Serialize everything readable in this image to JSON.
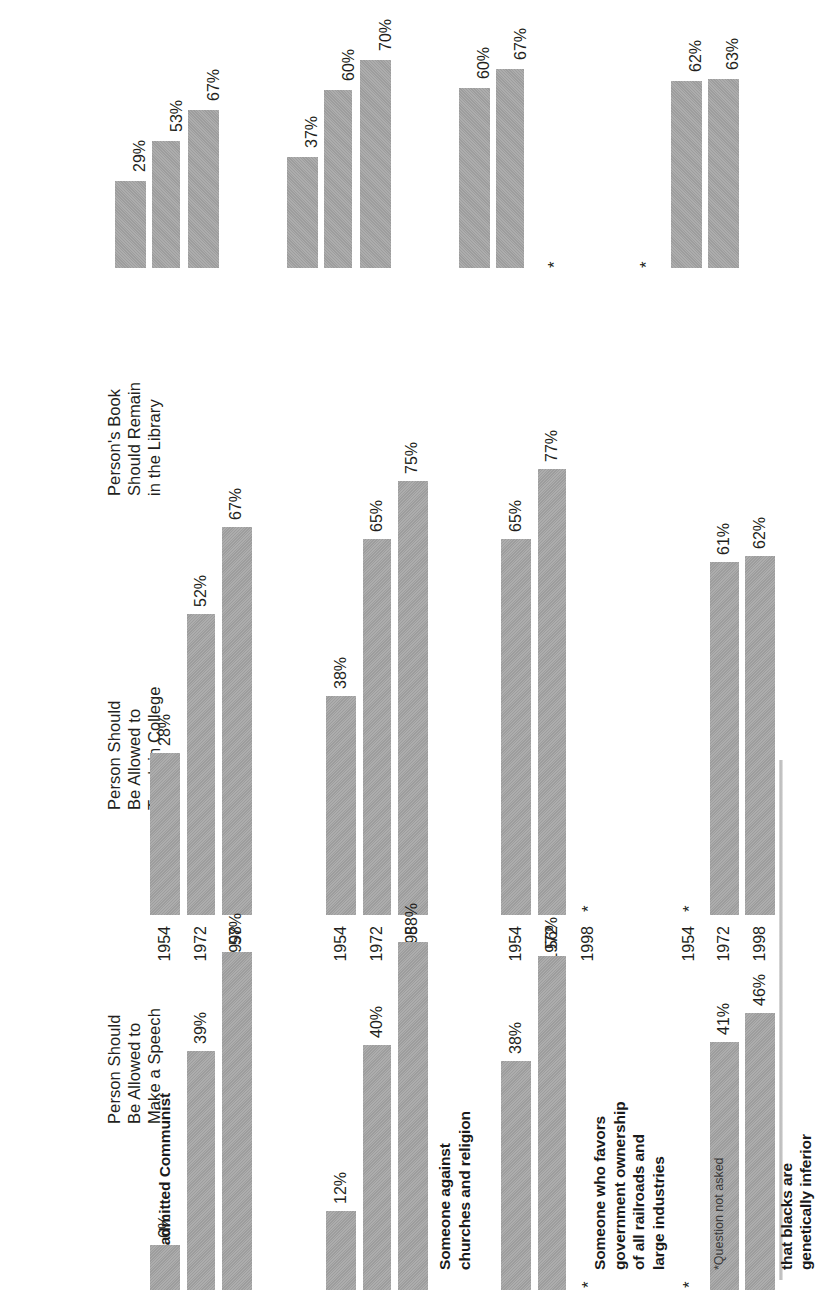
{
  "figure": {
    "footnote": "*Question not asked",
    "not_asked_mark": "*",
    "bar_color": "#9d9d9d",
    "text_color": "#231f20"
  },
  "panels": [
    {
      "title": "Person Should\nBe Allowed to\nMake a Speech"
    },
    {
      "title": "Person Should\nBe Allowed to\nTeach in College"
    },
    {
      "title": "Person's Book\nShould Remain\nin the Library"
    }
  ],
  "groups": [
    {
      "label": "An admitted Communist"
    },
    {
      "label": "Someone against\nchurches and religion"
    },
    {
      "label": "Someone who favors\ngovernment ownership\nof all railroads and\nlarge industries"
    },
    {
      "label": "Someone who believes\nthat blacks are\ngenetically inferior"
    }
  ],
  "years": [
    "1954",
    "1972",
    "1998"
  ],
  "chart_data": {
    "type": "bar",
    "title": "",
    "xlabel": "",
    "ylabel": "",
    "ylim": [
      0,
      100
    ],
    "grid": false,
    "legend_position": "none",
    "categories": [
      "1954",
      "1972",
      "1998"
    ],
    "group_labels": [
      "An admitted Communist",
      "Someone against churches and religion",
      "Someone who favors government ownership of all railroads and large industries",
      "Someone who believes that blacks are genetically inferior"
    ],
    "panels": [
      {
        "name": "Person Should Be Allowed to Make a Speech",
        "groups": [
          {
            "group": "An admitted Communist",
            "values": [
              28,
              52,
              67
            ],
            "labels": [
              "28%",
              "52%",
              "67%"
            ]
          },
          {
            "group": "Someone against churches and religion",
            "values": [
              38,
              65,
              75
            ],
            "labels": [
              "38%",
              "65%",
              "75%"
            ]
          },
          {
            "group": "Someone who favors government ownership of all railroads and large industries",
            "values": [
              65,
              77,
              null
            ],
            "labels": [
              "65%",
              "77%",
              "*"
            ]
          },
          {
            "group": "Someone who believes that blacks are genetically inferior",
            "values": [
              null,
              61,
              62
            ],
            "labels": [
              "*",
              "61%",
              "62%"
            ]
          }
        ]
      },
      {
        "name": "Person Should Be Allowed to Teach in College",
        "groups": [
          {
            "group": "An admitted Communist",
            "values": [
              6,
              39,
              57
            ],
            "labels": [
              "6%",
              "39%",
              "57%"
            ]
          },
          {
            "group": "Someone against churches and religion",
            "values": [
              12,
              40,
              58
            ],
            "labels": [
              "12%",
              "40%",
              "58%"
            ]
          },
          {
            "group": "Someone who favors government ownership of all railroads and large industries",
            "values": [
              38,
              56,
              null
            ],
            "labels": [
              "38%",
              "56%",
              "*"
            ]
          },
          {
            "group": "Someone who believes that blacks are genetically inferior",
            "values": [
              null,
              41,
              46
            ],
            "labels": [
              "*",
              "41%",
              "46%"
            ]
          }
        ]
      },
      {
        "name": "Person's Book Should Remain in the Library",
        "groups": [
          {
            "group": "An admitted Communist",
            "values": [
              29,
              53,
              67
            ],
            "labels": [
              "29%",
              "53%",
              "67%"
            ]
          },
          {
            "group": "Someone against churches and religion",
            "values": [
              37,
              60,
              70
            ],
            "labels": [
              "37%",
              "60%",
              "70%"
            ]
          },
          {
            "group": "Someone who favors government ownership of all railroads and large industries",
            "values": [
              60,
              67,
              null
            ],
            "labels": [
              "60%",
              "67%",
              "*"
            ]
          },
          {
            "group": "Someone who believes that blacks are genetically inferior",
            "values": [
              null,
              62,
              63
            ],
            "labels": [
              "*",
              "62%",
              "63%"
            ]
          }
        ]
      }
    ],
    "note": "*Question not asked"
  }
}
